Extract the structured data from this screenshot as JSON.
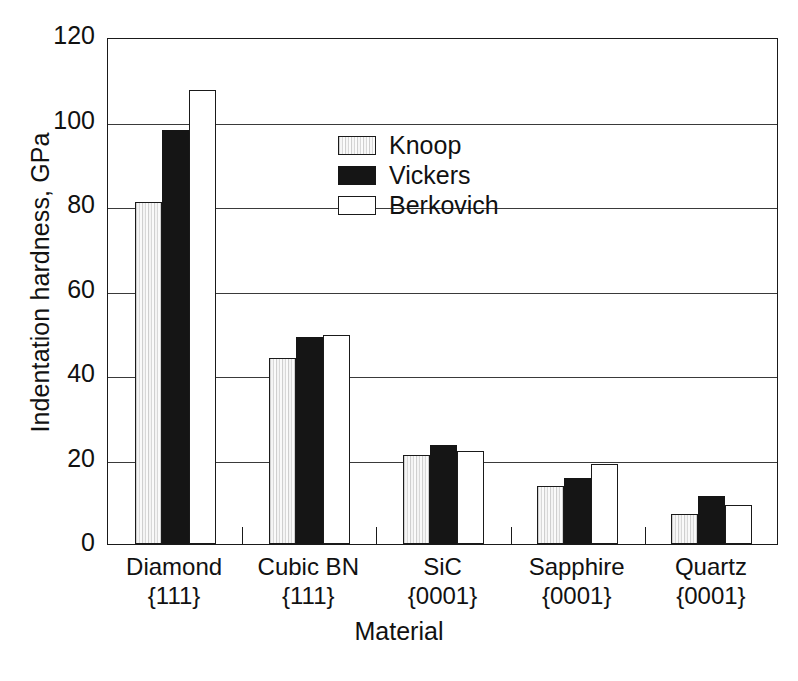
{
  "chart_data": {
    "type": "bar",
    "title": "",
    "xlabel": "Material",
    "ylabel": "Indentation hardness, GPa",
    "ylim": [
      0,
      120
    ],
    "yticks": [
      0,
      20,
      40,
      60,
      80,
      100,
      120
    ],
    "grid": true,
    "legend_position": "inside-top-center",
    "categories": [
      {
        "line1": "Diamond",
        "line2": "{111}"
      },
      {
        "line1": "Cubic BN",
        "line2": "{111}"
      },
      {
        "line1": "SiC",
        "line2": "{0001}"
      },
      {
        "line1": "Sapphire",
        "line2": "{0001}"
      },
      {
        "line1": "Quartz",
        "line2": "{0001}"
      }
    ],
    "category_labels": [
      "Diamond {111}",
      "Cubic BN {111}",
      "SiC {0001}",
      "Sapphire {0001}",
      "Quartz {0001}"
    ],
    "series": [
      {
        "name": "Knoop",
        "fill": "light-gray-vertical-hatch",
        "color": "#e9e9e9",
        "values": [
          81,
          44,
          21,
          13.8,
          7
        ]
      },
      {
        "name": "Vickers",
        "fill": "solid-black",
        "color": "#151515",
        "values": [
          98,
          49,
          23.5,
          15.7,
          11.3
        ]
      },
      {
        "name": "Berkovich",
        "fill": "white-outline",
        "color": "#ffffff",
        "values": [
          107.5,
          49.5,
          22,
          19,
          9.3
        ]
      }
    ]
  }
}
